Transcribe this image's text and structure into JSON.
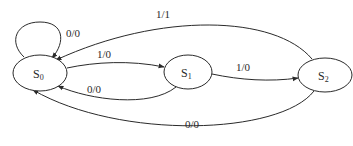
{
  "diagram": {
    "type": "finite-state-machine",
    "states": [
      {
        "id": "S0",
        "base": "S",
        "sub": "0"
      },
      {
        "id": "S1",
        "base": "S",
        "sub": "1"
      },
      {
        "id": "S2",
        "base": "S",
        "sub": "2"
      }
    ],
    "transitions": [
      {
        "from": "S0",
        "to": "S0",
        "label": "0/0"
      },
      {
        "from": "S0",
        "to": "S1",
        "label": "1/0"
      },
      {
        "from": "S1",
        "to": "S0",
        "label": "0/0"
      },
      {
        "from": "S1",
        "to": "S2",
        "label": "1/0"
      },
      {
        "from": "S2",
        "to": "S0",
        "label": "1/1"
      },
      {
        "from": "S2",
        "to": "S0",
        "label": "0/0"
      }
    ],
    "colors": {
      "stroke": "#2a2a2a",
      "background": "#ffffff"
    }
  }
}
